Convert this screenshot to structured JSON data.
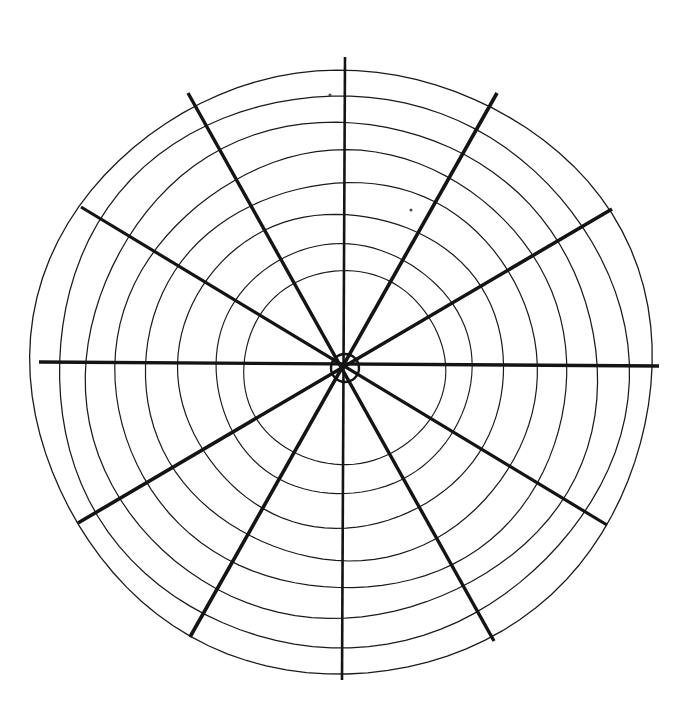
{
  "figure": {
    "caption": "",
    "background_color": "#ffffff",
    "ink_color": "#1a1a1a",
    "spoke_color": "#141414",
    "canvas": {
      "width": 687,
      "height": 725
    },
    "center": {
      "x": 343,
      "y": 368
    },
    "hub": {
      "radius": 14,
      "stroke_width": 2.4
    },
    "ring_count": 8,
    "spoke_count": 12,
    "specks": [
      {
        "x": 330,
        "y": 95,
        "r": 1.6
      },
      {
        "x": 411,
        "y": 210,
        "r": 1.5
      }
    ]
  },
  "chart_data": {
    "type": "line",
    "subtitle": "",
    "xlabel": "",
    "ylabel": "",
    "grid": true,
    "legend_position": "none",
    "axis_ranges": {
      "radius": [
        0,
        305
      ],
      "angle_deg": [
        0,
        360
      ]
    },
    "tick_labels": {
      "radial": [],
      "angular": []
    },
    "annotations": [],
    "rings": [
      {
        "index": 1,
        "radius": 98,
        "rx": 101,
        "ry": 97,
        "cx": 344,
        "cy": 368,
        "rotation": -2,
        "stroke_width": 1.15
      },
      {
        "index": 2,
        "radius": 126,
        "rx": 128,
        "ry": 125,
        "cx": 343,
        "cy": 369,
        "rotation": -1,
        "stroke_width": 1.15
      },
      {
        "index": 3,
        "radius": 159,
        "rx": 163,
        "ry": 157,
        "cx": 341,
        "cy": 370,
        "rotation": 2,
        "stroke_width": 1.2
      },
      {
        "index": 4,
        "radius": 191,
        "rx": 196,
        "ry": 189,
        "cx": 342,
        "cy": 371,
        "rotation": -2,
        "stroke_width": 1.2
      },
      {
        "index": 5,
        "radius": 221,
        "rx": 226,
        "ry": 219,
        "cx": 342,
        "cy": 371,
        "rotation": 1,
        "stroke_width": 1.2
      },
      {
        "index": 6,
        "radius": 250,
        "rx": 256,
        "ry": 248,
        "cx": 341,
        "cy": 371,
        "rotation": -1,
        "stroke_width": 1.25
      },
      {
        "index": 7,
        "radius": 278,
        "rx": 285,
        "ry": 276,
        "cx": 341,
        "cy": 371,
        "rotation": 2,
        "stroke_width": 1.25
      },
      {
        "index": 8,
        "radius": 304,
        "rx": 311,
        "ry": 302,
        "cx": 342,
        "cy": 371,
        "rotation": -1,
        "stroke_width": 1.3
      }
    ],
    "spokes": [
      {
        "label": "N",
        "angle_deg": 0,
        "x1": 345,
        "y1": 57,
        "x2": 342,
        "y2": 680,
        "stroke_width": 2.6
      },
      {
        "label": "NNE",
        "angle_deg": 30,
        "x1": 497,
        "y1": 93,
        "x2": 190,
        "y2": 637,
        "stroke_width": 3.6
      },
      {
        "label": "ENE",
        "angle_deg": 60,
        "x1": 612,
        "y1": 209,
        "x2": 78,
        "y2": 523,
        "stroke_width": 3.6
      },
      {
        "label": "E",
        "angle_deg": 90,
        "x1": 659,
        "y1": 366,
        "x2": 39,
        "y2": 362,
        "stroke_width": 3.4
      },
      {
        "label": "ESE",
        "angle_deg": 120,
        "x1": 607,
        "y1": 525,
        "x2": 81,
        "y2": 207,
        "stroke_width": 3.2
      },
      {
        "label": "SSE",
        "angle_deg": 150,
        "x1": 494,
        "y1": 641,
        "x2": 188,
        "y2": 93,
        "stroke_width": 3.4
      }
    ]
  }
}
